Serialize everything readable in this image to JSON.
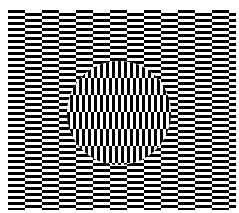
{
  "figure": {
    "type": "optical-illusion",
    "name": "Ouchi illusion",
    "background_color": "#ffffff",
    "ink_color": "#000000",
    "field": {
      "x": 8,
      "y": 10,
      "width": 228,
      "height": 200
    },
    "tile": {
      "width": 17,
      "stripe": 3,
      "period": 6
    },
    "circle": {
      "cx": 119,
      "cy": 113,
      "r": 52
    }
  }
}
